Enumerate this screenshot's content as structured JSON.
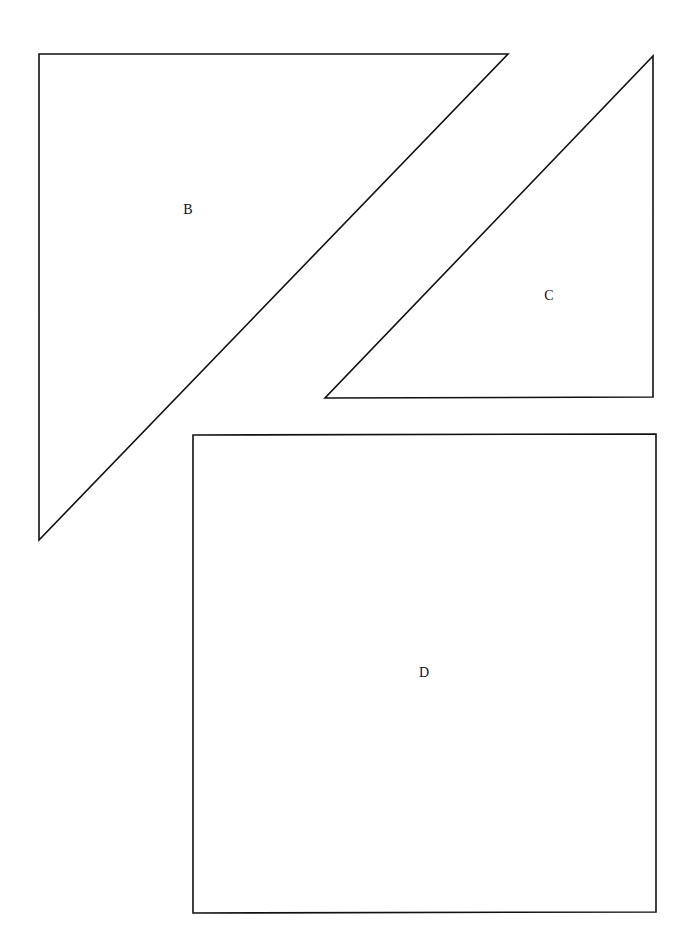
{
  "diagram": {
    "background": "#ffffff",
    "stroke_color": "#111111",
    "shapes": [
      {
        "id": "B",
        "type": "right-triangle",
        "label": "B",
        "points": [
          [
            39,
            54
          ],
          [
            508,
            54
          ],
          [
            39,
            540
          ]
        ],
        "label_pos": [
          188,
          210
        ]
      },
      {
        "id": "C",
        "type": "right-triangle",
        "label": "C",
        "points": [
          [
            653,
            56
          ],
          [
            653,
            397
          ],
          [
            325,
            398
          ]
        ],
        "label_pos": [
          549,
          296
        ]
      },
      {
        "id": "D",
        "type": "square",
        "label": "D",
        "points": [
          [
            193,
            435
          ],
          [
            656,
            434
          ],
          [
            656,
            912
          ],
          [
            193,
            913
          ]
        ],
        "label_pos": [
          424,
          673
        ]
      }
    ]
  }
}
